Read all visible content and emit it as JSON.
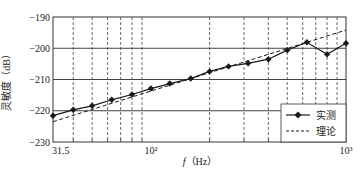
{
  "chart_data": {
    "type": "line",
    "title": "",
    "xlabel": "f（Hz）",
    "xlabel_italic": "f",
    "xlabel_unit": "（Hz）",
    "ylabel": "灵敏度（dB）",
    "xscale": "log",
    "xlim": [
      31.5,
      1000
    ],
    "ylim": [
      -230,
      -190
    ],
    "x_tick_labels": [
      {
        "value": 31.5,
        "label": "31.5"
      },
      {
        "value": 100,
        "label": "10²"
      },
      {
        "value": 1000,
        "label": "10³"
      }
    ],
    "y_tick_labels": [
      {
        "value": -190,
        "label": "−190"
      },
      {
        "value": -200,
        "label": "−200"
      },
      {
        "value": -210,
        "label": "−210"
      },
      {
        "value": -220,
        "label": "−220"
      },
      {
        "value": -230,
        "label": "−230"
      }
    ],
    "grid": {
      "horizontal": [
        -200,
        -210,
        -220
      ],
      "vertical_minor": [
        40,
        50,
        60,
        70,
        80,
        90,
        200,
        300,
        400,
        500,
        600,
        700,
        800,
        900
      ]
    },
    "legend_position": "lower right",
    "series": [
      {
        "name": "实测",
        "style": "solid-diamond",
        "x": [
          31.5,
          40,
          50,
          63,
          80,
          100,
          125,
          160,
          200,
          250,
          315,
          400,
          500,
          630,
          800,
          1000
        ],
        "values": [
          -221.6,
          -219.7,
          -218.4,
          -216.5,
          -214.8,
          -212.9,
          -211.3,
          -209.7,
          -207.4,
          -205.8,
          -204.8,
          -203.5,
          -200.6,
          -198.1,
          -201.9,
          -198.4
        ]
      },
      {
        "name": "理论",
        "style": "dashed",
        "x": [
          31.5,
          1000
        ],
        "values": [
          -223.5,
          -194.2
        ]
      }
    ]
  },
  "colors": {
    "line": "#1a1a1a",
    "grid": "#555555",
    "background": "#ffffff"
  }
}
